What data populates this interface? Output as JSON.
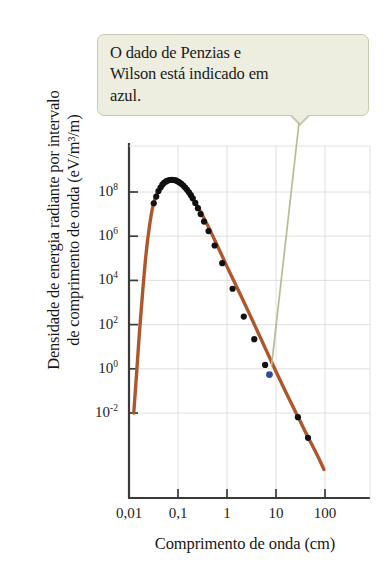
{
  "callout": {
    "text": "O dado de Penzias e\nWilson está indicado em\nazul.",
    "bg_color": "#eeeee0",
    "border_color": "#c9c9b4"
  },
  "chart_data": {
    "type": "line",
    "title": "",
    "xlabel": "Comprimento de onda (cm)",
    "ylabel": "Densidade de energia radiante por intervalo\nde comprimento de onda (eV/m³/m)",
    "xscale": "log",
    "yscale": "log",
    "xlim": [
      0.01,
      300
    ],
    "ylim": [
      0.01,
      1000000000.0
    ],
    "grid": true,
    "legend": null,
    "xticks": [
      "0,01",
      "0,1",
      "1",
      "10",
      "100"
    ],
    "xtick_values": [
      0.01,
      0.1,
      1,
      10,
      100
    ],
    "yticks": [
      "10^8",
      "10^6",
      "10^4",
      "10^2",
      "10^0",
      "10^-2"
    ],
    "ytick_values": [
      100000000.0,
      1000000.0,
      10000.0,
      100.0,
      1.0,
      0.01
    ],
    "ytick_mantissas": [
      "10",
      "10",
      "10",
      "10",
      "10",
      "10"
    ],
    "ytick_exponents": [
      "8",
      "6",
      "4",
      "2",
      "0",
      "-2"
    ],
    "series": [
      {
        "name": "Curva de corpo negro (2,7 K)",
        "type": "line",
        "color": "#b0562c",
        "points": [
          [
            0.0125,
            0.01
          ],
          [
            0.0145,
            1.0
          ],
          [
            0.0165,
            60
          ],
          [
            0.019,
            3000
          ],
          [
            0.022,
            120000
          ],
          [
            0.026,
            2600000
          ],
          [
            0.031,
            25000000
          ],
          [
            0.038,
            95000000
          ],
          [
            0.047,
            200000000
          ],
          [
            0.058,
            300000000
          ],
          [
            0.072,
            360000000
          ],
          [
            0.09,
            330000000
          ],
          [
            0.11,
            250000000
          ],
          [
            0.135,
            160000000
          ],
          [
            0.17,
            85000000
          ],
          [
            0.21,
            42000000
          ],
          [
            0.27,
            17000000
          ],
          [
            0.34,
            6500000
          ],
          [
            0.44,
            2100000
          ],
          [
            0.57,
            620000
          ],
          [
            0.75,
            170000
          ],
          [
            1.0,
            42000
          ],
          [
            1.4,
            9000
          ],
          [
            2.0,
            1700
          ],
          [
            2.9,
            290
          ],
          [
            4.3,
            44
          ],
          [
            6.5,
            6.0
          ],
          [
            10.0,
            0.75
          ],
          [
            16.0,
            0.085
          ],
          [
            26.0,
            0.0095
          ],
          [
            42.0,
            0.0011
          ],
          [
            70.0,
            0.00012
          ],
          [
            95.0,
            2.8e-05
          ]
        ]
      },
      {
        "name": "Dados medidos",
        "type": "scatter",
        "color": "#111111",
        "points": [
          [
            0.032,
            31000000
          ],
          [
            0.036,
            62000000
          ],
          [
            0.04,
            110000000
          ],
          [
            0.044,
            160000000
          ],
          [
            0.048,
            215000000
          ],
          [
            0.052,
            260000000
          ],
          [
            0.057,
            300000000
          ],
          [
            0.062,
            330000000
          ],
          [
            0.068,
            350000000
          ],
          [
            0.075,
            358000000
          ],
          [
            0.082,
            350000000
          ],
          [
            0.09,
            333000000
          ],
          [
            0.098,
            305000000
          ],
          [
            0.107,
            272000000
          ],
          [
            0.117,
            235000000
          ],
          [
            0.128,
            196000000
          ],
          [
            0.14,
            160000000
          ],
          [
            0.153,
            126000000
          ],
          [
            0.167,
            97000000
          ],
          [
            0.183,
            72000000
          ],
          [
            0.2,
            52000000
          ],
          [
            0.225,
            32000000
          ],
          [
            0.255,
            18500000
          ],
          [
            0.29,
            10000000
          ],
          [
            0.34,
            4600000
          ],
          [
            0.42,
            1700000
          ],
          [
            0.56,
            380000
          ],
          [
            0.8,
            60000
          ],
          [
            1.3,
            4200
          ],
          [
            2.2,
            230
          ],
          [
            3.6,
            22
          ],
          [
            6.0,
            1.5
          ],
          [
            28.0,
            0.0065
          ],
          [
            45.0,
            0.00075
          ]
        ]
      },
      {
        "name": "Penzias e Wilson",
        "type": "scatter",
        "color": "#2c4d9e",
        "points": [
          [
            7.35,
            0.55
          ]
        ]
      }
    ]
  }
}
